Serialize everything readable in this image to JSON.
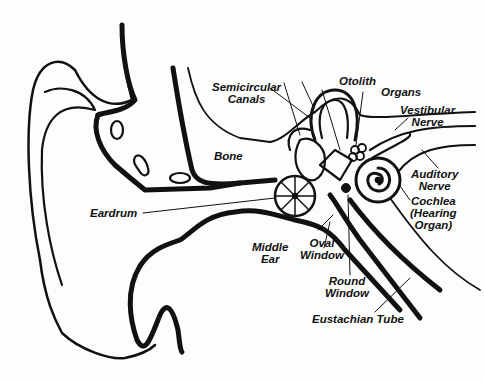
{
  "diagram": {
    "colors": {
      "ink": "#111111",
      "background": "#fdfdfd"
    },
    "labels": {
      "semicircular_canals": {
        "line1": "Semicircular",
        "line2": "Canals"
      },
      "otolith": "Otolith",
      "organs": "Organs",
      "vestibular_nerve": {
        "line1": "Vestibular",
        "line2": "Nerve"
      },
      "bone": "Bone",
      "auditory_nerve": {
        "line1": "Auditory",
        "line2": "Nerve"
      },
      "cochlea": {
        "line1": "Cochlea",
        "line2": "(Hearing",
        "line3": "Organ)"
      },
      "eardrum": "Eardrum",
      "middle_ear": {
        "line1": "Middle",
        "line2": "Ear"
      },
      "oval_window": {
        "line1": "Oval",
        "line2": "Window"
      },
      "round_window": {
        "line1": "Round",
        "line2": "Window"
      },
      "eustachian_tube": "Eustachian Tube"
    }
  }
}
